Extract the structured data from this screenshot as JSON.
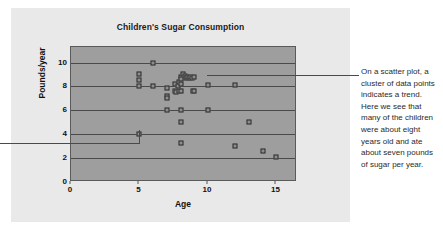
{
  "chart_data": {
    "type": "scatter",
    "title": "Children's Sugar Consumption",
    "xlabel": "Age",
    "ylabel": "Pounds/year",
    "xlim": [
      0,
      16.5
    ],
    "ylim": [
      0,
      11.3
    ],
    "xticks": [
      0,
      5,
      10,
      15
    ],
    "yticks": [
      0,
      2,
      4,
      6,
      8,
      10
    ],
    "grid": true,
    "legend": "none",
    "series": [
      {
        "name": "children",
        "points": [
          [
            5.0,
            9.0
          ],
          [
            5.0,
            8.5
          ],
          [
            5.0,
            8.0
          ],
          [
            5.0,
            4.0
          ],
          [
            6.0,
            10.0
          ],
          [
            6.0,
            8.0
          ],
          [
            7.0,
            7.9
          ],
          [
            7.0,
            7.2
          ],
          [
            7.0,
            7.0
          ],
          [
            7.0,
            6.0
          ],
          [
            7.6,
            8.2
          ],
          [
            7.6,
            7.6
          ],
          [
            7.7,
            7.5
          ],
          [
            7.8,
            8.0
          ],
          [
            7.9,
            8.4
          ],
          [
            7.9,
            7.6
          ],
          [
            8.0,
            8.8
          ],
          [
            8.0,
            8.6
          ],
          [
            8.0,
            8.2
          ],
          [
            8.0,
            7.6
          ],
          [
            8.0,
            6.0
          ],
          [
            8.0,
            5.0
          ],
          [
            8.0,
            3.3
          ],
          [
            8.2,
            9.0
          ],
          [
            8.3,
            8.9
          ],
          [
            8.4,
            8.7
          ],
          [
            8.5,
            8.8
          ],
          [
            8.6,
            8.7
          ],
          [
            8.7,
            8.8
          ],
          [
            8.8,
            8.7
          ],
          [
            8.9,
            7.6
          ],
          [
            9.0,
            8.8
          ],
          [
            9.0,
            7.6
          ],
          [
            10.0,
            8.1
          ],
          [
            10.0,
            6.0
          ],
          [
            12.0,
            8.1
          ],
          [
            12.0,
            3.0
          ],
          [
            13.0,
            5.0
          ],
          [
            14.0,
            2.6
          ],
          [
            15.0,
            2.1
          ]
        ]
      }
    ]
  },
  "annotation": {
    "text": "On a scatter plot, a cluster of data points indicates a trend. Here we see that many of the children were about eight years old and ate about seven pounds of sugar per year."
  }
}
